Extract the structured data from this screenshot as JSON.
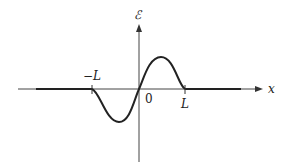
{
  "figure": {
    "type": "wave-pulse diagram",
    "y_axis_label": "ℰ",
    "x_axis_label": "x",
    "origin_label": "0",
    "tick_labels": {
      "left": "−L",
      "right": "L"
    },
    "colors": {
      "line": "#222222",
      "axis": "#444444",
      "background": "#ffffff"
    }
  }
}
